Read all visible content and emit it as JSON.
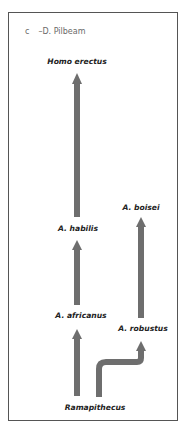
{
  "figure": {
    "panel_letter": "c",
    "attribution": "–D. Pilbeam",
    "arrow_color": "#6e6e6e",
    "frame_color": "#555555"
  },
  "taxa": {
    "homo_erectus": "Homo erectus",
    "a_habilis": "A. habilis",
    "a_boisei": "A. boisei",
    "a_africanus": "A. africanus",
    "a_robustus": "A. robustus",
    "ramapithecus": "Ramapithecus"
  },
  "lineages": [
    {
      "from": "Ramapithecus",
      "to": "A. africanus"
    },
    {
      "from": "Ramapithecus",
      "to": "A. robustus"
    },
    {
      "from": "A. africanus",
      "to": "A. habilis"
    },
    {
      "from": "A. habilis",
      "to": "Homo erectus"
    },
    {
      "from": "A. robustus",
      "to": "A. boisei"
    }
  ]
}
